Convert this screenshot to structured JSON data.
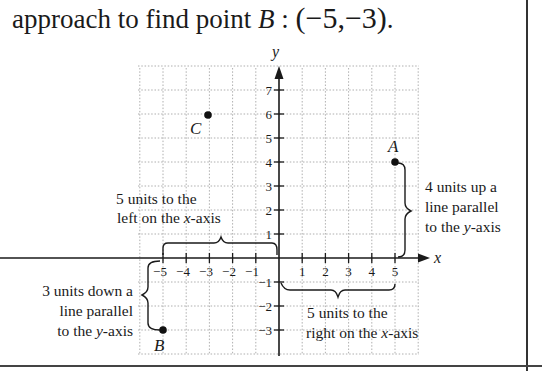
{
  "heading": {
    "prefix": "approach to find point ",
    "point": "B",
    "colon": " : ",
    "coords": "(−5,−3)",
    "suffix": "."
  },
  "axes": {
    "x_label": "x",
    "y_label": "y",
    "x_ticks": [
      "−5",
      "−4",
      "−3",
      "−2",
      "−1",
      "1",
      "2",
      "3",
      "4",
      "5"
    ],
    "y_ticks_pos": [
      "1",
      "2",
      "3",
      "4",
      "5",
      "6",
      "7"
    ],
    "y_ticks_neg": [
      "−1",
      "−2",
      "−3"
    ]
  },
  "points": [
    {
      "label": "A",
      "x": 5,
      "y": 4
    },
    {
      "label": "B",
      "x": -5,
      "y": -3
    },
    {
      "label": "C",
      "x": -3,
      "y": 6
    }
  ],
  "annotations": {
    "left_x": [
      "5 units to the",
      "left on the ",
      "x",
      "-axis"
    ],
    "down_y": [
      "3 units down a",
      "line parallel",
      "to the ",
      "y",
      "-axis"
    ],
    "up_y": [
      "4 units up a",
      "line parallel",
      "to the ",
      "y",
      "-axis"
    ],
    "right_x": [
      "5 units to the",
      "right on the ",
      "x",
      "-axis"
    ]
  }
}
